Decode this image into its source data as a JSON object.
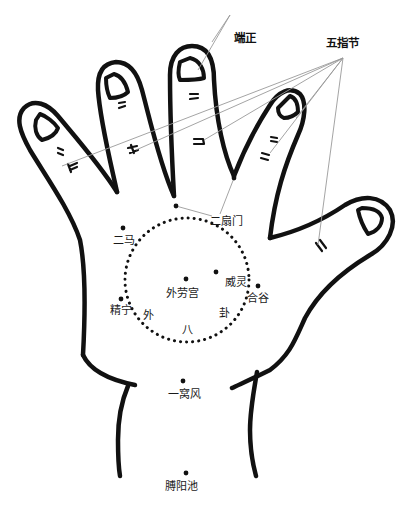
{
  "diagram": {
    "colors": {
      "outline": "#111111",
      "leader_line": "#9a9a9a",
      "dot": "#111111",
      "background": "#ffffff"
    },
    "top_labels": {
      "duanzheng": "端正",
      "wuzhijie": "五指节"
    },
    "points": [
      {
        "id": "ershanmen",
        "label": "二扇门",
        "dots": [
          [
            176,
            206
          ],
          [
            234,
            178
          ]
        ],
        "label_pos": [
          210,
          216
        ]
      },
      {
        "id": "erma",
        "label": "二马",
        "dot": [
          123,
          228
        ],
        "label_pos": [
          113,
          235
        ]
      },
      {
        "id": "wailaogong",
        "label": "外劳宫",
        "dot": [
          186,
          279
        ],
        "label_pos": [
          165,
          288
        ]
      },
      {
        "id": "weiling",
        "label": "威灵",
        "dot": [
          216,
          272
        ],
        "label_pos": [
          225,
          277
        ]
      },
      {
        "id": "hegu",
        "label": "合谷",
        "dot": [
          258,
          286
        ],
        "label_pos": [
          247,
          293
        ]
      },
      {
        "id": "jingning",
        "label": "精宁",
        "dot": [
          121,
          299
        ],
        "label_pos": [
          110,
          305
        ]
      },
      {
        "id": "yiwofeng",
        "label": "一窝风",
        "dot": [
          183,
          381
        ],
        "label_pos": [
          168,
          389
        ]
      },
      {
        "id": "boyangchi",
        "label": "膊阳池",
        "dot": [
          186,
          473
        ],
        "label_pos": [
          164,
          481
        ]
      }
    ],
    "circle_labels": {
      "wai": "外",
      "ba": "八",
      "gua": "卦"
    },
    "circle_name": "外八卦",
    "knuckle_marks": {
      "little_finger": [
        "=",
        "="
      ],
      "ring_finger": [
        "=",
        "="
      ],
      "middle_finger": [
        "=",
        "="
      ],
      "index_finger": [
        "=",
        "="
      ],
      "thumb": [
        "="
      ]
    }
  }
}
